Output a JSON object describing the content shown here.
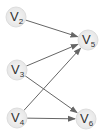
{
  "diagram": {
    "type": "directed-graph",
    "nodes": [
      {
        "id": "V2",
        "letter": "V",
        "sub": "2",
        "x": 16,
        "y": 17
      },
      {
        "id": "V3",
        "letter": "V",
        "sub": "3",
        "x": 17,
        "y": 70
      },
      {
        "id": "V4",
        "letter": "V",
        "sub": "4",
        "x": 17,
        "y": 118
      },
      {
        "id": "V5",
        "letter": "V",
        "sub": "5",
        "x": 88,
        "y": 40
      },
      {
        "id": "V6",
        "letter": "V",
        "sub": "6",
        "x": 86,
        "y": 119
      }
    ],
    "edges": [
      {
        "from": "V2",
        "to": "V5"
      },
      {
        "from": "V3",
        "to": "V5"
      },
      {
        "from": "V3",
        "to": "V6"
      },
      {
        "from": "V4",
        "to": "V5"
      },
      {
        "from": "V4",
        "to": "V6"
      }
    ],
    "colors": {
      "edge": "#666666",
      "node_fill": "#eeeeee",
      "node_stroke": "#dddddd",
      "text": "#333333"
    }
  }
}
